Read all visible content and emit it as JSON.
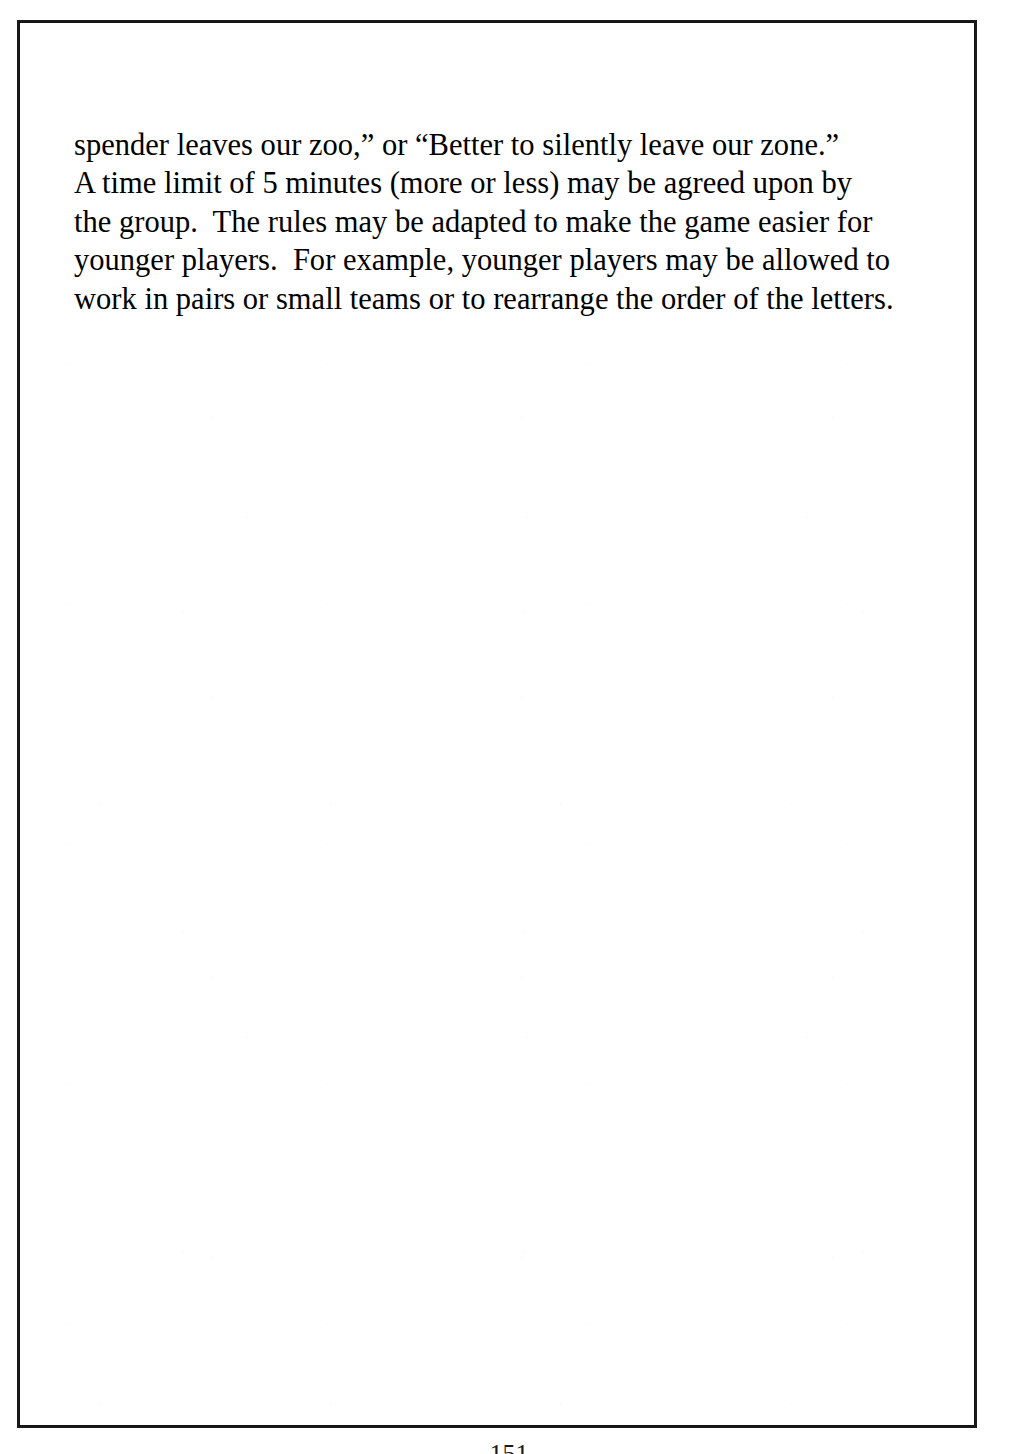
{
  "document": {
    "type": "scanned-book-page",
    "background_color": "#ffffff",
    "ink_color": "#000000",
    "border_color": "#1a1a1a"
  },
  "body": {
    "lines": [
      "spender leaves our zoo,” or “Better to silently leave our zone.”",
      "A time limit of 5 minutes (more or less) may be agreed upon by",
      "the group.  The rules may be adapted to make the game easier for",
      "younger players.  For example, younger players may be allowed to",
      "work in pairs or small teams or to rearrange the order of the letters."
    ],
    "full_text": "spender leaves our zoo,” or “Better to silently leave our zone.” A time limit of 5 minutes (more or less) may be agreed upon by the group.  The rules may be adapted to make the game easier for younger players.  For example, younger players may be allowed to work in pairs or small teams or to rearrange the order of the letters."
  },
  "footer": {
    "page_number": "151"
  }
}
